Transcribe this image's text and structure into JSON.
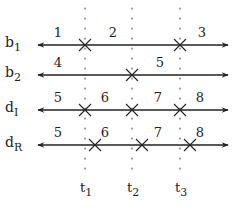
{
  "diagram": {
    "time_markers": [
      {
        "label": "t",
        "sub": "1",
        "x": 85
      },
      {
        "label": "t",
        "sub": "2",
        "x": 132
      },
      {
        "label": "t",
        "sub": "3",
        "x": 180
      }
    ],
    "rows": [
      {
        "label": "b",
        "sub": "1",
        "y": 45,
        "crosses": [
          85,
          180
        ],
        "segments": [
          {
            "text": "1",
            "x": 58
          },
          {
            "text": "2",
            "x": 113
          },
          {
            "text": "3",
            "x": 202
          }
        ]
      },
      {
        "label": "b",
        "sub": "2",
        "y": 75,
        "crosses": [
          132
        ],
        "segments": [
          {
            "text": "4",
            "x": 58
          },
          {
            "text": "5",
            "x": 160
          }
        ]
      },
      {
        "label": "d",
        "sub": "I",
        "y": 110,
        "crosses": [
          85,
          132,
          180
        ],
        "segments": [
          {
            "text": "5",
            "x": 58
          },
          {
            "text": "6",
            "x": 105
          },
          {
            "text": "7",
            "x": 158
          },
          {
            "text": "8",
            "x": 200
          }
        ]
      },
      {
        "label": "d",
        "sub": "R",
        "y": 145,
        "crosses": [
          95,
          142,
          190
        ],
        "segments": [
          {
            "text": "5",
            "x": 58
          },
          {
            "text": "6",
            "x": 105
          },
          {
            "text": "7",
            "x": 158
          },
          {
            "text": "8",
            "x": 200
          }
        ]
      }
    ]
  }
}
